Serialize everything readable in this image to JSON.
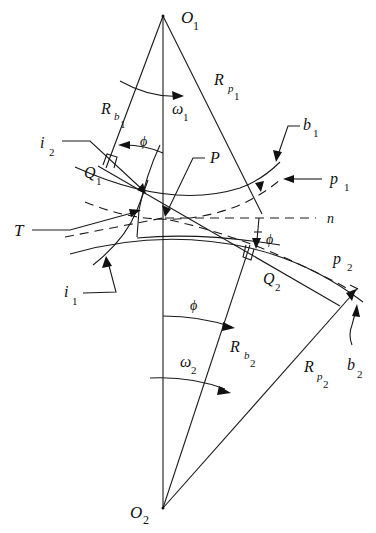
{
  "diagram": {
    "labels": {
      "O1": {
        "main": "O",
        "sub": "1"
      },
      "O2": {
        "main": "O",
        "sub": "2"
      },
      "Rp1": {
        "main": "R",
        "sub": "p",
        "subsub": "1"
      },
      "Rp2": {
        "main": "R",
        "sub": "p",
        "subsub": "2"
      },
      "Rb1": {
        "main": "R",
        "sub": "b",
        "subsub": "1"
      },
      "Rb2": {
        "main": "R",
        "sub": "b",
        "subsub": "2"
      },
      "omega1": {
        "main": "ω",
        "sub": "1"
      },
      "omega2": {
        "main": "ω",
        "sub": "2"
      },
      "phi_top": "ϕ",
      "phi_right": "ϕ",
      "phi_bottom": "ϕ",
      "b1": {
        "main": "b",
        "sub": "1"
      },
      "b2": {
        "main": "b",
        "sub": "2"
      },
      "p1": {
        "main": "p",
        "sub": "1"
      },
      "p2": {
        "main": "p",
        "sub": "2"
      },
      "i1": {
        "main": "i",
        "sub": "1"
      },
      "i2": {
        "main": "i",
        "sub": "2"
      },
      "Q1": {
        "main": "Q",
        "sub": "1"
      },
      "Q2": {
        "main": "Q",
        "sub": "2"
      },
      "P": "P",
      "T": "T",
      "n": "n"
    },
    "elements": [
      "center-line O1-O2",
      "base radius Rb1",
      "pitch radius Rp1",
      "base radius Rb2",
      "pitch radius Rp2",
      "line of action Q1-Q2 through P",
      "pitch circles p1, p2 (dashed)",
      "base circles b1, b2",
      "involute curves i1, i2",
      "common tangent n (dashed)",
      "pressure angle ϕ"
    ],
    "colors": {
      "line": "#1a1a1a",
      "background": "#ffffff"
    }
  }
}
